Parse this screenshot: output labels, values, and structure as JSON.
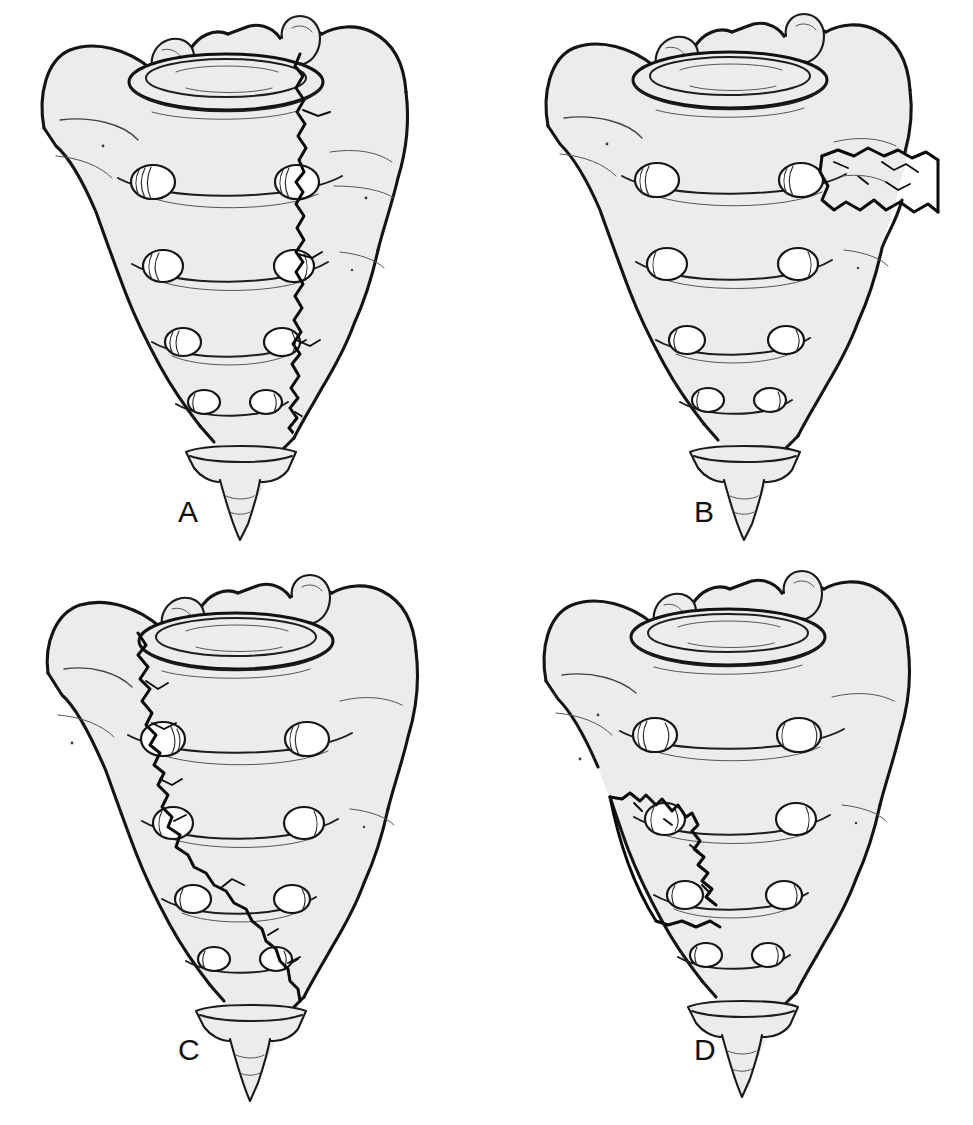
{
  "figure": {
    "background_color": "#ffffff",
    "bone_fill_color": "#ececec",
    "outline_color": "#141414",
    "fracture_color": "#0a0a0a",
    "label_color": "#111111",
    "panel_count": 4,
    "layout": "2x2 grid"
  },
  "panels": [
    {
      "id": "A",
      "label": "A",
      "position": "top-left",
      "fracture_pattern": "transforaminal vertical fracture",
      "fracture_description": "Jagged vertical fracture line descending from the sacral promontory at the S1 endplate through all four right anterior sacral foramina to the lower right sacrum.",
      "fracture_zone": "Zone II (transforaminal)",
      "foramina_rows": 4,
      "foramina_per_row": 2,
      "fracture_crosses_foramina": true
    },
    {
      "id": "B",
      "label": "B",
      "position": "top-right",
      "fracture_pattern": "lateral ala fracture",
      "fracture_description": "Irregular horizontal fracture through the right sacral ala, lateral to the first foramen, isolating a wedge-shaped lateral fragment.",
      "fracture_zone": "Zone I (alar, lateral to foramina)",
      "foramina_rows": 4,
      "foramina_per_row": 2,
      "fracture_crosses_foramina": false
    },
    {
      "id": "C",
      "label": "C",
      "position": "bottom-left",
      "fracture_pattern": "oblique transforaminal fracture",
      "fracture_description": "Long oblique fracture beginning at the upper left ala beside the S1 superior articular process, crossing the left foraminal line and angling inferolaterally toward the lower right sacrum.",
      "fracture_zone": "Zone II oblique",
      "foramina_rows": 4,
      "foramina_per_row": 2,
      "fracture_crosses_foramina": true
    },
    {
      "id": "D",
      "label": "D",
      "position": "bottom-right",
      "fracture_pattern": "lower lateral margin fracture",
      "fracture_description": "Short jagged vertical fracture along the inferior left lateral margin of the sacrum, producing a small peripheral fragment below the third foramen.",
      "fracture_zone": "Zone I (inferolateral margin)",
      "foramina_rows": 4,
      "foramina_per_row": 2,
      "fracture_crosses_foramina": false
    }
  ],
  "anatomy": {
    "structures": [
      "S1 superior endplate",
      "sacral promontory",
      "superior articular processes",
      "sacral ala (wing)",
      "anterior sacral foramina",
      "transverse ridges",
      "sacral apex",
      "coccyx"
    ]
  }
}
